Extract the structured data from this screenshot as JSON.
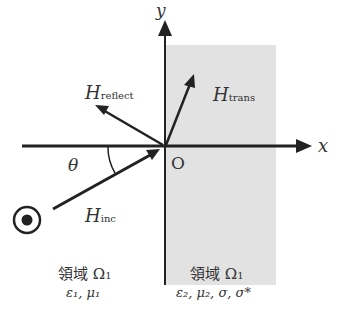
{
  "axes": {
    "x_label": "x",
    "y_label": "y",
    "origin_label": "O"
  },
  "angle_label": "θ",
  "vectors": {
    "incident": {
      "symbol": "H",
      "subscript": "inc"
    },
    "reflected": {
      "symbol": "H",
      "subscript": "reflect"
    },
    "transmitted": {
      "symbol": "H",
      "subscript": "trans"
    }
  },
  "regions": {
    "left": {
      "name": "領域 Ω",
      "subscript": "1",
      "params": "ε₁, μ₁"
    },
    "right": {
      "name": "領域 Ω",
      "subscript": "1",
      "params": "ε₂, μ₂, σ, σ*"
    }
  },
  "colors": {
    "shade": "#e2e2e2",
    "line": "#222222"
  }
}
